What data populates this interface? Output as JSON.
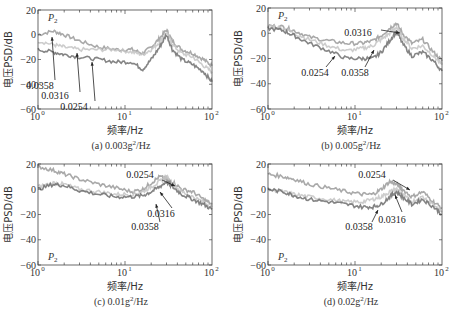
{
  "figure": {
    "ylabel": "电压PSD/dB",
    "xlabel": "频率/Hz",
    "point_label": "P",
    "point_sub": "2"
  },
  "chart_data": [
    {
      "type": "line",
      "panel": "a",
      "caption": "(a) 0.003g²/Hz",
      "caption_main": "(a) 0.003g",
      "caption_unit": "/Hz",
      "xlabel": "频率/Hz",
      "ylabel": "电压PSD/dB",
      "xscale": "log",
      "xlim": [
        1,
        100
      ],
      "ylim": [
        -60,
        20
      ],
      "yticks": [
        20,
        0,
        -20,
        -40,
        -60
      ],
      "xticks": [
        "10^0",
        "10^1",
        "10^2"
      ],
      "legend_label": "P2",
      "x": [
        1,
        1.5,
        2,
        3,
        5,
        8,
        12,
        16,
        20,
        25,
        30,
        35,
        45,
        60,
        80,
        100
      ],
      "series": [
        {
          "name": "0.0358",
          "values": [
            0,
            3,
            0,
            -5,
            -10,
            -12,
            -12,
            -15,
            -10,
            -3,
            4,
            -5,
            -12,
            -15,
            -20,
            -25
          ]
        },
        {
          "name": "0.0316",
          "values": [
            -5,
            -8,
            -10,
            -12,
            -12,
            -12,
            -14,
            -16,
            -12,
            -6,
            2,
            -8,
            -15,
            -18,
            -25,
            -30
          ]
        },
        {
          "name": "0.0254",
          "values": [
            -12,
            -14,
            -16,
            -18,
            -20,
            -22,
            -22,
            -28,
            -20,
            -10,
            0,
            -12,
            -20,
            -24,
            -30,
            -38
          ]
        }
      ],
      "annotations": [
        {
          "text": "0.0358",
          "x": 1.3,
          "y": -20
        },
        {
          "text": "0.0316",
          "x": 2.1,
          "y": -30
        },
        {
          "text": "0.0254",
          "x": 3.4,
          "y": -40
        }
      ]
    },
    {
      "type": "line",
      "panel": "b",
      "caption": "(b) 0.005g²/Hz",
      "caption_main": "(b) 0.005g",
      "caption_unit": "/Hz",
      "xlabel": "频率/Hz",
      "ylabel": "电压PSD/dB",
      "xscale": "log",
      "xlim": [
        1,
        100
      ],
      "ylim": [
        -60,
        20
      ],
      "yticks": [
        20,
        0,
        -20,
        -40,
        -60
      ],
      "xticks": [
        "10^0",
        "10^1",
        "10^2"
      ],
      "legend_label": "P2",
      "x": [
        1,
        1.5,
        2,
        3,
        5,
        8,
        12,
        16,
        20,
        25,
        30,
        35,
        45,
        60,
        80,
        100
      ],
      "series": [
        {
          "name": "0.0316",
          "values": [
            6,
            5,
            2,
            -3,
            -6,
            -8,
            -8,
            -6,
            -2,
            4,
            8,
            0,
            -8,
            -5,
            -15,
            -22
          ]
        },
        {
          "name": "0.0254",
          "values": [
            6,
            4,
            0,
            -5,
            -10,
            -14,
            -12,
            -10,
            -5,
            0,
            5,
            -3,
            -12,
            -10,
            -18,
            -25
          ]
        },
        {
          "name": "0.0358",
          "values": [
            4,
            2,
            -2,
            -8,
            -14,
            -20,
            -20,
            -20,
            -15,
            -6,
            2,
            -8,
            -18,
            -15,
            -22,
            -30
          ]
        }
      ],
      "annotations": [
        {
          "text": "0.0316",
          "x": 12,
          "y": 5
        },
        {
          "text": "0.0254",
          "x": 4.5,
          "y": -30
        },
        {
          "text": "0.0358",
          "x": 12,
          "y": -30
        }
      ]
    },
    {
      "type": "line",
      "panel": "c",
      "caption": "(c) 0.01g²/Hz",
      "caption_main": "(c) 0.01g",
      "caption_unit": "/Hz",
      "xlabel": "频率/Hz",
      "ylabel": "电压PSD/dB",
      "xscale": "log",
      "xlim": [
        1,
        100
      ],
      "ylim": [
        -60,
        20
      ],
      "yticks": [
        20,
        0,
        -20,
        -40,
        -60
      ],
      "xticks": [
        "10^0",
        "10^1",
        "10^2"
      ],
      "legend_label": "P2",
      "x": [
        1,
        1.5,
        2,
        3,
        5,
        8,
        12,
        16,
        20,
        25,
        30,
        35,
        45,
        60,
        80,
        100
      ],
      "series": [
        {
          "name": "0.0254",
          "values": [
            18,
            15,
            12,
            8,
            4,
            1,
            -2,
            0,
            5,
            10,
            8,
            6,
            0,
            -2,
            -8,
            -12
          ]
        },
        {
          "name": "0.0316",
          "values": [
            2,
            5,
            4,
            0,
            -2,
            -4,
            -4,
            -2,
            2,
            6,
            10,
            4,
            -2,
            -6,
            -10,
            -14
          ]
        },
        {
          "name": "0.0358",
          "values": [
            0,
            4,
            3,
            -1,
            -4,
            -6,
            -6,
            -5,
            -2,
            2,
            6,
            2,
            -4,
            -8,
            -12,
            -16
          ]
        }
      ],
      "annotations": [
        {
          "text": "0.0254",
          "x": 7,
          "y": 12
        },
        {
          "text": "0.0316",
          "x": 30,
          "y": -20
        },
        {
          "text": "0.0358",
          "x": 22,
          "y": -30
        }
      ]
    },
    {
      "type": "line",
      "panel": "d",
      "caption": "(d) 0.02g²/Hz",
      "caption_main": "(d) 0.02g",
      "caption_unit": "/Hz",
      "xlabel": "频率/Hz",
      "ylabel": "电压PSD/dB",
      "xscale": "log",
      "xlim": [
        1,
        100
      ],
      "ylim": [
        -60,
        20
      ],
      "yticks": [
        20,
        0,
        -20,
        -40,
        -60
      ],
      "xticks": [
        "10^0",
        "10^1",
        "10^2"
      ],
      "legend_label": "P2",
      "x": [
        1,
        1.5,
        2,
        3,
        5,
        8,
        12,
        16,
        20,
        25,
        30,
        35,
        45,
        60,
        80,
        100
      ],
      "series": [
        {
          "name": "0.0254",
          "values": [
            12,
            10,
            8,
            4,
            1,
            -2,
            -4,
            -4,
            0,
            6,
            4,
            0,
            -6,
            -2,
            -10,
            -15
          ]
        },
        {
          "name": "0.0316",
          "values": [
            0,
            -2,
            -4,
            -6,
            -8,
            -10,
            -10,
            -8,
            -6,
            -2,
            0,
            -4,
            -10,
            -6,
            -12,
            -18
          ]
        },
        {
          "name": "0.0358",
          "values": [
            0,
            -2,
            -5,
            -8,
            -10,
            -12,
            -14,
            -14,
            -12,
            -6,
            -2,
            -6,
            -12,
            -8,
            -14,
            -20
          ]
        }
      ],
      "annotations": [
        {
          "text": "0.0254",
          "x": 9,
          "y": 12
        },
        {
          "text": "0.0316",
          "x": 36,
          "y": -25
        },
        {
          "text": "0.0358",
          "x": 13,
          "y": -30
        }
      ]
    }
  ]
}
